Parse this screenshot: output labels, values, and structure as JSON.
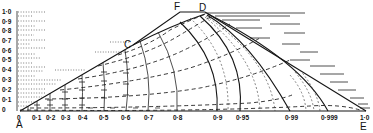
{
  "diagram": {
    "type": "flow-net / equipotential diagram",
    "points": {
      "A": "A",
      "C": "C",
      "D": "D",
      "E": "E",
      "F": "F"
    },
    "y_axis": {
      "ticks": [
        "0",
        "0·1",
        "0·2",
        "0·3",
        "0·4",
        "0·5",
        "0·6",
        "0·7",
        "0·8",
        "0·9",
        "1·0"
      ]
    },
    "x_axis": {
      "ticks": [
        "0",
        "0·1",
        "0·2",
        "0·3",
        "0·4",
        "0·5",
        "0·6",
        "0·7",
        "0·8",
        "0·9",
        "0·95",
        "0·99",
        "0·999",
        "1·0"
      ]
    },
    "colors": {
      "ink": "#151515",
      "background": "#ffffff"
    }
  }
}
